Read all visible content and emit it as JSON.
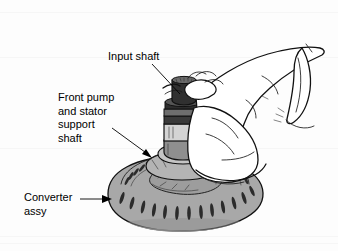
{
  "figure": {
    "background_color": "#fdfdfd",
    "ink_color": "#111111",
    "converter_fill": "#a8a8a8",
    "converter_shadow": "#8e8e8e",
    "shaft_dark": "#2e2e2e",
    "shaft_mid": "#9a9a9a",
    "shaft_light": "#d8d8d8",
    "hand_fill": "#ffffff"
  },
  "callouts": [
    {
      "id": "input-shaft",
      "line1": "Input shaft",
      "line2": "",
      "line3": "",
      "line4": "",
      "text_x": 108,
      "text_y": 60,
      "leader": "M 152 64 L 180 94",
      "arrow": ""
    },
    {
      "id": "front-pump-stator-support-shaft",
      "line1": "Front pump",
      "line2": "and stator",
      "line3": "support",
      "line4": "shaft",
      "text_x": 58,
      "text_y": 101,
      "leader": "M 112 128 L 150 156",
      "arrow": "M 150 156 L 142 152 L 145 148 Z"
    },
    {
      "id": "converter-assy",
      "line1": "Converter",
      "line2": "assy",
      "line3": "",
      "line4": "",
      "text_x": 24,
      "text_y": 201,
      "leader": "M 82 199 L 108 199",
      "arrow": "M 112 199 L 103 195 L 103 203 Z"
    }
  ],
  "parts": {
    "converter_label": "converter-assembly",
    "input_shaft_label": "input-shaft",
    "pump_shaft_label": "front-pump-stator-support-shaft",
    "hand_label": "technician-hand"
  }
}
